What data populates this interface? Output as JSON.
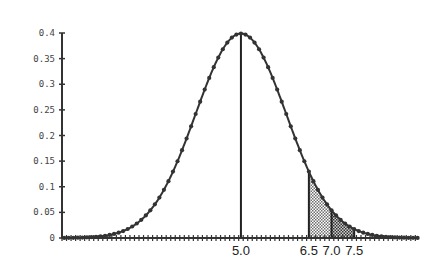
{
  "chart_data": {
    "type": "line",
    "title": "",
    "xlabel": "",
    "ylabel": "",
    "xlim": [
      1.05,
      9.0
    ],
    "ylim": [
      0,
      0.4
    ],
    "grid": false,
    "legend": null,
    "yticks": [
      0,
      0.05,
      0.1,
      0.15,
      0.2,
      0.25,
      0.3,
      0.35,
      0.4
    ],
    "ytick_labels": [
      "0",
      "0.05",
      "0.1",
      "0.15",
      "0.2",
      "0.25",
      "0.3",
      "0.35",
      "0.4"
    ],
    "xtick_labels": [
      {
        "value": 5.0,
        "label": "5.0"
      },
      {
        "value": 6.5,
        "label": "6.5"
      },
      {
        "value": 7.0,
        "label": "7.0"
      },
      {
        "value": 7.5,
        "label": "7.5"
      }
    ],
    "distribution": {
      "mean": 5.0,
      "sd": 1.0
    },
    "series": [
      {
        "name": "normal density",
        "x": [
          1.0,
          1.5,
          2.0,
          2.5,
          3.0,
          3.5,
          4.0,
          4.5,
          5.0,
          5.5,
          6.0,
          6.5,
          7.0,
          7.5,
          8.0,
          8.5,
          9.0
        ],
        "y": [
          0.0001,
          0.0009,
          0.0044,
          0.0175,
          0.054,
          0.1295,
          0.242,
          0.3521,
          0.3989,
          0.3521,
          0.242,
          0.1295,
          0.054,
          0.0175,
          0.0044,
          0.0009,
          0.0001
        ]
      }
    ],
    "vertical_lines": [
      5.0,
      6.5,
      7.0,
      7.5
    ],
    "shaded_regions": [
      {
        "from": 6.5,
        "to": 7.0,
        "shade": "light"
      },
      {
        "from": 7.0,
        "to": 7.5,
        "shade": "dark"
      }
    ]
  },
  "style": {
    "curve_color": "#333333",
    "axis_color": "#333333",
    "light_shade": "#bdbdbd",
    "dark_shade": "#8a8a8a"
  }
}
